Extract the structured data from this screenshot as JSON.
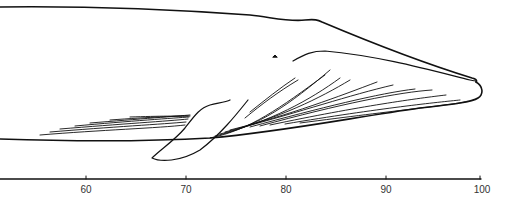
{
  "diagram": {
    "ruler": {
      "ticks": [
        {
          "value": "60",
          "x": 86
        },
        {
          "value": "70",
          "x": 186
        },
        {
          "value": "80",
          "x": 286
        },
        {
          "value": "90",
          "x": 386
        },
        {
          "value": "100",
          "x": 480
        }
      ]
    }
  }
}
